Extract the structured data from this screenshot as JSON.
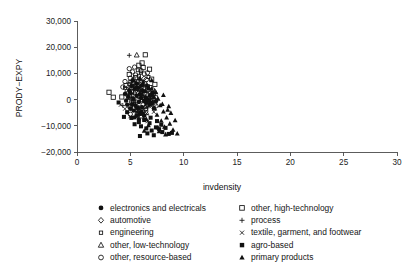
{
  "chart_data": {
    "type": "scatter",
    "title": "",
    "xlabel": "invdensity",
    "ylabel": "PRODY−EXPY",
    "xlim": [
      0,
      30
    ],
    "ylim": [
      -20000,
      30000
    ],
    "xticks": [
      0,
      5,
      10,
      15,
      20,
      25,
      30
    ],
    "xtick_labels": [
      "0",
      "5",
      "10",
      "15",
      "20",
      "25",
      "30"
    ],
    "yticks": [
      -20000,
      -10000,
      0,
      10000,
      20000,
      30000
    ],
    "ytick_labels": [
      "−20,000",
      "−10,000",
      "0",
      "10,000",
      "20,000",
      "30,000"
    ],
    "grid": false,
    "legend_position": "below",
    "series": [
      {
        "name": "electronics and electricals",
        "marker": "filled-circle",
        "points": [
          [
            5.1,
            5200
          ],
          [
            5.4,
            4100
          ],
          [
            5.0,
            2600
          ],
          [
            5.6,
            1500
          ],
          [
            5.3,
            300
          ],
          [
            5.8,
            -900
          ],
          [
            5.2,
            -1800
          ],
          [
            5.7,
            -3100
          ],
          [
            6.0,
            600
          ],
          [
            6.3,
            -500
          ],
          [
            5.9,
            2100
          ],
          [
            6.2,
            3300
          ],
          [
            4.8,
            1100
          ],
          [
            4.6,
            -400
          ],
          [
            5.5,
            -2400
          ],
          [
            6.1,
            -2900
          ],
          [
            6.5,
            -1200
          ],
          [
            6.4,
            900
          ],
          [
            5.0,
            -3500
          ],
          [
            5.7,
            4600
          ],
          [
            6.8,
            -2000
          ],
          [
            4.9,
            3600
          ],
          [
            6.6,
            200
          ],
          [
            5.3,
            -4200
          ],
          [
            7.0,
            -1500
          ],
          [
            6.0,
            -4800
          ],
          [
            5.6,
            6100
          ],
          [
            6.9,
            1800
          ],
          [
            4.5,
            2200
          ],
          [
            7.2,
            -3300
          ],
          [
            5.2,
            7300
          ],
          [
            6.3,
            -6100
          ],
          [
            5.9,
            -5400
          ],
          [
            7.4,
            -600
          ],
          [
            4.7,
            -1900
          ],
          [
            6.7,
            4200
          ],
          [
            5.4,
            -6800
          ],
          [
            6.1,
            5500
          ],
          [
            7.1,
            2600
          ],
          [
            5.8,
            -7600
          ]
        ]
      },
      {
        "name": "automotive",
        "marker": "open-diamond",
        "points": [
          [
            5.5,
            3400
          ],
          [
            5.9,
            1900
          ],
          [
            6.2,
            700
          ],
          [
            5.2,
            -800
          ],
          [
            6.6,
            -2100
          ],
          [
            5.7,
            5100
          ],
          [
            6.4,
            2900
          ],
          [
            5.0,
            1200
          ],
          [
            6.9,
            -400
          ],
          [
            6.1,
            -3400
          ],
          [
            5.4,
            6400
          ],
          [
            7.0,
            1400
          ],
          [
            5.8,
            -5100
          ],
          [
            6.7,
            3800
          ],
          [
            4.9,
            -2600
          ],
          [
            7.3,
            -1700
          ],
          [
            6.3,
            8100
          ],
          [
            5.6,
            -4300
          ]
        ]
      },
      {
        "name": "engineering",
        "marker": "small-open-square",
        "points": [
          [
            5.0,
            6800
          ],
          [
            5.4,
            5300
          ],
          [
            5.7,
            4000
          ],
          [
            6.0,
            2700
          ],
          [
            5.2,
            1600
          ],
          [
            6.3,
            500
          ],
          [
            5.5,
            -700
          ],
          [
            6.6,
            -1900
          ],
          [
            5.9,
            -3000
          ],
          [
            6.1,
            3500
          ],
          [
            4.7,
            2400
          ],
          [
            6.8,
            1100
          ],
          [
            5.1,
            -2200
          ],
          [
            7.0,
            -300
          ],
          [
            6.4,
            6200
          ],
          [
            5.8,
            9100
          ],
          [
            4.5,
            4500
          ],
          [
            7.2,
            2000
          ],
          [
            6.2,
            -4600
          ],
          [
            5.3,
            7700
          ],
          [
            6.9,
            4800
          ],
          [
            5.6,
            -5700
          ],
          [
            7.4,
            900
          ],
          [
            6.5,
            -3700
          ],
          [
            4.9,
            5900
          ],
          [
            6.0,
            10300
          ],
          [
            5.7,
            11200
          ],
          [
            6.7,
            8600
          ]
        ]
      },
      {
        "name": "other, low-technology",
        "marker": "open-triangle",
        "points": [
          [
            5.6,
            17000
          ],
          [
            5.0,
            4300
          ],
          [
            5.4,
            2800
          ],
          [
            5.8,
            1300
          ],
          [
            6.1,
            -200
          ],
          [
            5.2,
            -1400
          ],
          [
            6.4,
            -2600
          ],
          [
            5.9,
            3900
          ],
          [
            6.7,
            600
          ],
          [
            5.5,
            -3800
          ],
          [
            6.2,
            5600
          ],
          [
            7.0,
            2300
          ],
          [
            4.8,
            800
          ],
          [
            6.9,
            -1100
          ],
          [
            5.7,
            7100
          ],
          [
            6.5,
            -5000
          ],
          [
            7.3,
            3100
          ],
          [
            6.0,
            -6300
          ]
        ]
      },
      {
        "name": "other, resource-based",
        "marker": "open-circle",
        "points": [
          [
            4.9,
            11800
          ],
          [
            5.2,
            10600
          ],
          [
            5.5,
            9400
          ],
          [
            5.0,
            8200
          ],
          [
            5.8,
            7000
          ],
          [
            5.3,
            6300
          ],
          [
            6.1,
            5100
          ],
          [
            5.6,
            4400
          ],
          [
            4.7,
            3200
          ],
          [
            6.4,
            2500
          ],
          [
            5.9,
            1300
          ],
          [
            6.7,
            400
          ],
          [
            5.1,
            -900
          ],
          [
            6.2,
            -2000
          ],
          [
            5.7,
            -3200
          ],
          [
            6.9,
            -1300
          ],
          [
            4.5,
            6900
          ],
          [
            6.5,
            7600
          ],
          [
            7.1,
            3700
          ],
          [
            5.4,
            12400
          ],
          [
            6.0,
            11100
          ],
          [
            6.3,
            9800
          ],
          [
            5.8,
            -4500
          ],
          [
            7.2,
            300
          ],
          [
            6.6,
            10200
          ],
          [
            4.3,
            4800
          ],
          [
            7.4,
            -2400
          ],
          [
            5.0,
            -5600
          ]
        ]
      },
      {
        "name": "other, high-technology",
        "marker": "open-square",
        "points": [
          [
            6.4,
            17100
          ],
          [
            6.8,
            11600
          ],
          [
            5.1,
            3000
          ],
          [
            4.2,
            1000
          ],
          [
            3.4,
            900
          ],
          [
            5.5,
            8400
          ],
          [
            6.0,
            6500
          ],
          [
            5.8,
            13100
          ],
          [
            6.2,
            12200
          ],
          [
            4.6,
            5400
          ],
          [
            5.3,
            -1000
          ],
          [
            6.6,
            4900
          ],
          [
            5.0,
            -2700
          ],
          [
            7.0,
            7800
          ],
          [
            4.9,
            9600
          ],
          [
            6.9,
            2200
          ],
          [
            5.7,
            -4000
          ],
          [
            7.3,
            5800
          ],
          [
            6.1,
            14000
          ],
          [
            3.0,
            2800
          ]
        ]
      },
      {
        "name": "process",
        "marker": "plus",
        "points": [
          [
            4.9,
            16900
          ],
          [
            5.3,
            5000
          ],
          [
            5.7,
            3600
          ],
          [
            6.0,
            2100
          ],
          [
            5.1,
            800
          ],
          [
            6.3,
            -600
          ],
          [
            5.5,
            -1800
          ],
          [
            6.6,
            -3100
          ],
          [
            5.9,
            4700
          ],
          [
            6.9,
            1200
          ],
          [
            4.6,
            2000
          ],
          [
            6.1,
            -4400
          ],
          [
            7.1,
            -1000
          ],
          [
            5.4,
            6700
          ],
          [
            6.5,
            5300
          ],
          [
            4.3,
            -2300
          ],
          [
            7.3,
            2700
          ],
          [
            5.8,
            -5900
          ]
        ]
      },
      {
        "name": "textile, garment, and footwear",
        "marker": "cross",
        "points": [
          [
            5.2,
            2400
          ],
          [
            5.6,
            1100
          ],
          [
            5.9,
            -300
          ],
          [
            5.3,
            -1600
          ],
          [
            6.2,
            -2800
          ],
          [
            5.7,
            -4100
          ],
          [
            6.5,
            -5300
          ],
          [
            4.8,
            400
          ],
          [
            6.0,
            3700
          ],
          [
            6.8,
            -1200
          ],
          [
            5.0,
            -6400
          ],
          [
            6.3,
            -7100
          ],
          [
            4.5,
            -3500
          ],
          [
            7.0,
            -2500
          ],
          [
            5.5,
            5000
          ],
          [
            6.6,
            -8300
          ],
          [
            4.1,
            -2000
          ],
          [
            7.2,
            -4700
          ]
        ]
      },
      {
        "name": "agro-based",
        "marker": "filled-square",
        "points": [
          [
            5.4,
            -9400
          ],
          [
            6.0,
            -10200
          ],
          [
            6.5,
            -11000
          ],
          [
            7.0,
            -11800
          ],
          [
            5.8,
            -8600
          ],
          [
            6.3,
            -7800
          ],
          [
            6.8,
            -9000
          ],
          [
            7.4,
            -10600
          ],
          [
            8.0,
            -12400
          ],
          [
            8.6,
            -13100
          ],
          [
            5.1,
            -7000
          ],
          [
            6.6,
            -12900
          ],
          [
            7.2,
            -13600
          ],
          [
            5.6,
            -6200
          ],
          [
            7.7,
            -11300
          ],
          [
            6.1,
            -5400
          ],
          [
            4.7,
            -4800
          ],
          [
            8.3,
            -10800
          ],
          [
            5.9,
            -13900
          ],
          [
            7.5,
            -8200
          ],
          [
            3.9,
            -1100
          ],
          [
            4.4,
            -6600
          ],
          [
            6.9,
            -6900
          ],
          [
            8.9,
            -12700
          ],
          [
            7.9,
            -9600
          ]
        ]
      },
      {
        "name": "primary products",
        "marker": "filled-triangle",
        "points": [
          [
            6.2,
            6800
          ],
          [
            6.6,
            5400
          ],
          [
            7.0,
            4100
          ],
          [
            7.4,
            2800
          ],
          [
            6.9,
            1500
          ],
          [
            7.6,
            300
          ],
          [
            7.1,
            -1000
          ],
          [
            7.8,
            -2200
          ],
          [
            7.3,
            -3400
          ],
          [
            8.1,
            -4600
          ],
          [
            7.5,
            -5800
          ],
          [
            8.4,
            -6900
          ],
          [
            7.9,
            -8100
          ],
          [
            8.7,
            -9200
          ],
          [
            8.2,
            -10400
          ],
          [
            6.4,
            3300
          ],
          [
            6.8,
            -400
          ],
          [
            7.2,
            900
          ],
          [
            8.0,
            -1700
          ],
          [
            8.5,
            -3900
          ],
          [
            6.5,
            -7400
          ],
          [
            7.7,
            -12100
          ],
          [
            8.3,
            -13300
          ],
          [
            9.0,
            -11500
          ],
          [
            9.4,
            -13000
          ],
          [
            6.1,
            2000
          ],
          [
            7.0,
            7400
          ],
          [
            6.7,
            -9800
          ],
          [
            8.8,
            -5100
          ],
          [
            9.2,
            -7900
          ],
          [
            6.3,
            -11900
          ],
          [
            7.6,
            -10700
          ],
          [
            8.6,
            -2600
          ],
          [
            5.9,
            8200
          ],
          [
            8.1,
            1700
          ]
        ]
      }
    ]
  },
  "legend": {
    "left_column": [
      {
        "label": "electronics and electricals",
        "marker": "filled-circle"
      },
      {
        "label": "automotive",
        "marker": "open-diamond"
      },
      {
        "label": "engineering",
        "marker": "small-open-square"
      },
      {
        "label": "other, low-technology",
        "marker": "open-triangle"
      },
      {
        "label": "other, resource-based",
        "marker": "open-circle"
      }
    ],
    "right_column": [
      {
        "label": "other, high-technology",
        "marker": "open-square"
      },
      {
        "label": "process",
        "marker": "plus"
      },
      {
        "label": "textile, garment, and footwear",
        "marker": "cross"
      },
      {
        "label": "agro-based",
        "marker": "filled-square"
      },
      {
        "label": "primary products",
        "marker": "filled-triangle"
      }
    ]
  },
  "colors": {
    "marker": "#111111",
    "axis": "#4a4a4a",
    "text": "#161616",
    "background": "#ffffff"
  }
}
